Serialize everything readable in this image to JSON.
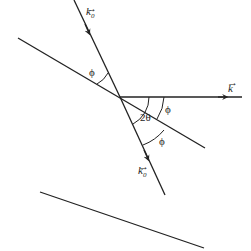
{
  "diagram": {
    "type": "bragg-scattering-geometry",
    "labels": {
      "incident_vector": "k",
      "incident_subscript": "0",
      "scattered_vector": "k",
      "transmitted_vector": "k",
      "transmitted_subscript": "0",
      "phi_upper": "ϕ",
      "phi_right": "ϕ",
      "phi_lower": "ϕ",
      "two_theta": "2θ"
    },
    "colors": {
      "line": "#222222",
      "background": "#ffffff"
    }
  }
}
